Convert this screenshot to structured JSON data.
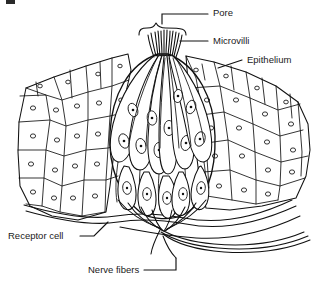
{
  "figure": {
    "background_color": "#ffffff",
    "ink_color": "#111111",
    "text_color": "#1a1a1a",
    "width": 321,
    "height": 285
  },
  "labels": {
    "pore": "Pore",
    "microvilli": "Microvilli",
    "epithelium": "Epithelium",
    "receptor_cell": "Receptor cell",
    "nerve_fibers": "Nerve fibers"
  },
  "label_positions": {
    "pore": {
      "x": 213,
      "y": 13
    },
    "microvilli": {
      "x": 213,
      "y": 41
    },
    "epithelium": {
      "x": 247,
      "y": 60
    },
    "receptor_cell": {
      "x": 8,
      "y": 236
    },
    "nerve_fibers": {
      "x": 88,
      "y": 270
    }
  },
  "parts": [
    {
      "name": "pore",
      "label": "Pore",
      "description": "opening at the epithelial surface marked by a brace"
    },
    {
      "name": "microvilli",
      "label": "Microvilli",
      "description": "hair-like projections extending into the taste pore"
    },
    {
      "name": "epithelium",
      "label": "Epithelium",
      "description": "stippled stratified cells surrounding the taste bud"
    },
    {
      "name": "receptor-cell",
      "label": "Receptor cell",
      "description": "elongated spindle-shaped gustatory cells with oval nuclei"
    },
    {
      "name": "nerve-fibers",
      "label": "Nerve fibers",
      "description": "afferent fibers converging beneath the taste bud"
    }
  ]
}
